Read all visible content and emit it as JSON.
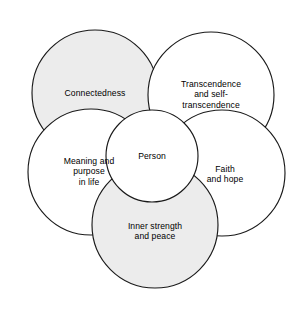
{
  "diagram": {
    "type": "venn-overlapping-circles",
    "colors": {
      "shaded_fill": "#ececec",
      "plain_fill": "#ffffff",
      "stroke": "#1a1a1a",
      "text": "#000000",
      "background": "#ffffff"
    },
    "center_node": {
      "id": "person",
      "label": "Person",
      "fill": "#ffffff",
      "cx": 152,
      "cy": 156,
      "r": 46
    },
    "nodes": [
      {
        "id": "connectedness",
        "label": "Connectedness",
        "fill": "#ececec",
        "shaded": true,
        "cx": 95,
        "cy": 93,
        "r": 63,
        "position": "top-left"
      },
      {
        "id": "transcendence",
        "label": "Transcendence\nand self-\ntranscendence",
        "fill": "#ffffff",
        "shaded": false,
        "cx": 211,
        "cy": 95,
        "r": 63,
        "position": "top-right"
      },
      {
        "id": "meaning-and-purpose",
        "label": "Meaning and\npurpose\nin life",
        "fill": "#ffffff",
        "shaded": false,
        "cx": 91,
        "cy": 172,
        "r": 63,
        "position": "left"
      },
      {
        "id": "faith-and-hope",
        "label": "Faith\nand hope",
        "fill": "#ffffff",
        "shaded": false,
        "cx": 222,
        "cy": 173,
        "r": 63,
        "position": "right"
      },
      {
        "id": "inner-strength",
        "label": "Inner strength\nand peace",
        "fill": "#ececec",
        "shaded": true,
        "cx": 155,
        "cy": 225,
        "r": 63,
        "position": "bottom"
      }
    ]
  }
}
